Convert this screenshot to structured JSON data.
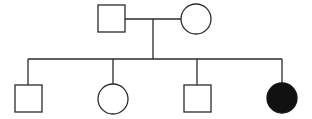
{
  "diagram": {
    "type": "pedigree",
    "colors": {
      "stroke": "#2a2a2a",
      "affected_fill": "#111111",
      "unaffected_fill": "#ffffff"
    },
    "parents": [
      {
        "id": "father",
        "sex": "male",
        "affected": false
      },
      {
        "id": "mother",
        "sex": "female",
        "affected": false
      }
    ],
    "children": [
      {
        "id": "child-1",
        "sex": "male",
        "affected": false
      },
      {
        "id": "child-2",
        "sex": "female",
        "affected": false
      },
      {
        "id": "child-3",
        "sex": "male",
        "affected": false
      },
      {
        "id": "child-4",
        "sex": "female",
        "affected": true
      }
    ]
  }
}
